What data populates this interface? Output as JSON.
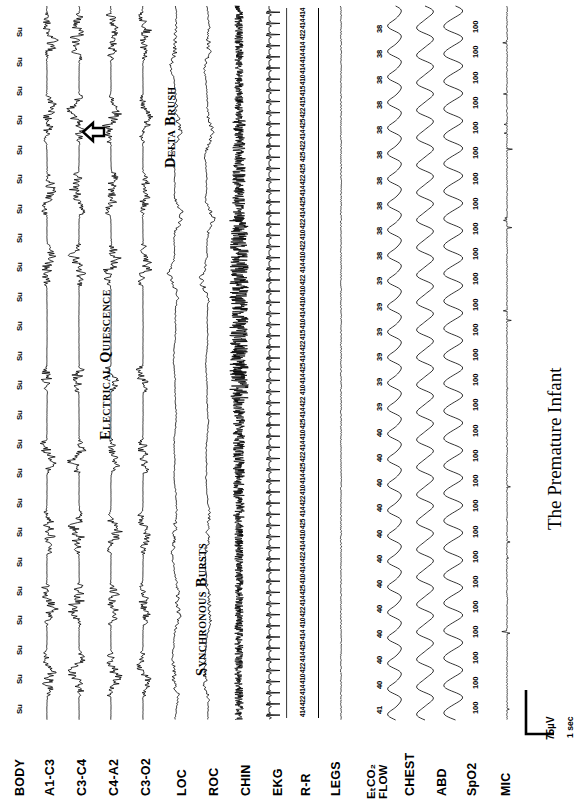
{
  "figure": {
    "title": "The Premature Infant",
    "orientation": "rotated-90-ccw",
    "background": "#ffffff",
    "trace_color": "#000000"
  },
  "calibration": {
    "amplitude": "75µV",
    "time": "1 sec"
  },
  "annotations": [
    {
      "name": "delta-brush",
      "text": "Delta Brush"
    },
    {
      "name": "electrical-quiescence",
      "text": "Electrical Quiescence"
    },
    {
      "name": "synchronous-bursts",
      "text": "Synchronous Bursts"
    }
  ],
  "channels": [
    {
      "id": "body",
      "label": "BODY",
      "kind": "marker"
    },
    {
      "id": "a1c3",
      "label": "A1-C3",
      "kind": "eeg"
    },
    {
      "id": "c3c4",
      "label": "C3-C4",
      "kind": "eeg"
    },
    {
      "id": "c4a2",
      "label": "C4-A2",
      "kind": "eeg"
    },
    {
      "id": "c3o2",
      "label": "C3-O2",
      "kind": "eeg"
    },
    {
      "id": "loc",
      "label": "LOC",
      "kind": "eog"
    },
    {
      "id": "roc",
      "label": "ROC",
      "kind": "eog"
    },
    {
      "id": "chin",
      "label": "CHIN",
      "kind": "emg"
    },
    {
      "id": "ekg",
      "label": "EKG",
      "kind": "ecg"
    },
    {
      "id": "rr",
      "label": "R-R",
      "kind": "numeric"
    },
    {
      "id": "legs",
      "label": "LEGS",
      "kind": "emg-flat"
    },
    {
      "id": "etco2",
      "label": "EₜCO₂ FLOW",
      "label_line1": "EₜCO₂",
      "label_line2": "FLOW",
      "kind": "numeric-wave"
    },
    {
      "id": "chest",
      "label": "CHEST",
      "kind": "resp"
    },
    {
      "id": "abd",
      "label": "ABD",
      "kind": "resp"
    },
    {
      "id": "spo2",
      "label": "SpO2",
      "kind": "numeric"
    },
    {
      "id": "mic",
      "label": "MIC",
      "kind": "flat"
    }
  ],
  "chart_data": {
    "type": "line",
    "title": "The Premature Infant",
    "subtitle": "Polysomnogram — 16 channel sleep study montage",
    "xlabel": "Time",
    "ylabel": "Channel",
    "grid": false,
    "legend": "none",
    "x_scale": "1 sec per calibration mark",
    "y_scale": "75 µV per calibration mark",
    "series": [
      {
        "name": "BODY",
        "type": "marker-text",
        "values": [
          "Su",
          "Su",
          "Su",
          "Su",
          "Su",
          "Su",
          "Su",
          "Su",
          "Su",
          "Su",
          "Su",
          "Su",
          "Su",
          "Su",
          "Su",
          "Su",
          "Su",
          "Su",
          "Su",
          "Su",
          "Su",
          "Su",
          "Su",
          "Su"
        ],
        "note": "Body position marker: Su = Supine, repeated across epoch"
      },
      {
        "name": "A1-C3",
        "type": "eeg",
        "pattern": "discontinuous burst-suppression (trace alternant)",
        "amplitude_uv": 75
      },
      {
        "name": "C3-C4",
        "type": "eeg",
        "pattern": "discontinuous burst-suppression with delta brush",
        "amplitude_uv": 90
      },
      {
        "name": "C4-A2",
        "type": "eeg",
        "pattern": "discontinuous burst-suppression (trace alternant)",
        "amplitude_uv": 80
      },
      {
        "name": "C3-O2",
        "type": "eeg",
        "pattern": "discontinuous burst-suppression (trace alternant)",
        "amplitude_uv": 70
      },
      {
        "name": "LOC",
        "type": "eog",
        "pattern": "slow eye movements, low amplitude"
      },
      {
        "name": "ROC",
        "type": "eog",
        "pattern": "slow eye movements, low amplitude"
      },
      {
        "name": "CHIN",
        "type": "emg",
        "pattern": "dense tonic high frequency EMG activity"
      },
      {
        "name": "EKG",
        "type": "ecg",
        "pattern": "regular QRS complexes",
        "approx_rate_bpm": 148
      },
      {
        "name": "R-R",
        "type": "numeric",
        "unit": "msec",
        "values": [
          "414",
          "414",
          "422",
          "414",
          "414",
          "414",
          "410",
          "415",
          "415",
          "422",
          "425",
          "414",
          "422",
          "425",
          "425",
          "422",
          "414",
          "425",
          "414",
          "422",
          "410",
          "422",
          "410",
          "414",
          "422",
          "410",
          "410",
          "414",
          "410",
          "415",
          "422",
          "414",
          "425",
          "414",
          "410",
          "422",
          "414",
          "425",
          "410",
          "414",
          "422",
          "425",
          "414",
          "410",
          "422",
          "414",
          "425",
          "410",
          "414",
          "422",
          "414",
          "410",
          "425",
          "414",
          "422",
          "410",
          "414",
          "425",
          "414",
          "422",
          "410",
          "414",
          "422",
          "414"
        ]
      },
      {
        "name": "LEGS",
        "type": "emg-flat",
        "pattern": "quiescent, no leg movements"
      },
      {
        "name": "EtCO2 FLOW",
        "type": "numeric-wave",
        "unit": "mmHg",
        "values": [
          "38",
          "38",
          "38",
          "38",
          "38",
          "38",
          "38",
          "38",
          "38",
          "38",
          "39",
          "39",
          "39",
          "39",
          "39",
          "39",
          "40",
          "40",
          "40",
          "40",
          "40",
          "40",
          "40",
          "40",
          "40",
          "40",
          "40",
          "41"
        ],
        "wave_pattern": "regular nasal airflow, sinusoidal"
      },
      {
        "name": "CHEST",
        "type": "resp",
        "pattern": "regular sinusoidal respiratory effort",
        "approx_rate_bpm": 46
      },
      {
        "name": "ABD",
        "type": "resp",
        "pattern": "regular sinusoidal respiratory effort, in phase with chest",
        "approx_rate_bpm": 46
      },
      {
        "name": "SpO2",
        "type": "numeric",
        "unit": "%",
        "values": [
          "100",
          "100",
          "100",
          "100",
          "100",
          "100",
          "100",
          "100",
          "100",
          "100",
          "100",
          "100",
          "100",
          "100",
          "100",
          "100",
          "100",
          "100",
          "100",
          "100",
          "100",
          "100",
          "100",
          "100",
          "100",
          "100",
          "100",
          "100"
        ]
      },
      {
        "name": "MIC",
        "type": "flat",
        "pattern": "flat baseline with sparse low amplitude artifact spikes"
      }
    ]
  }
}
